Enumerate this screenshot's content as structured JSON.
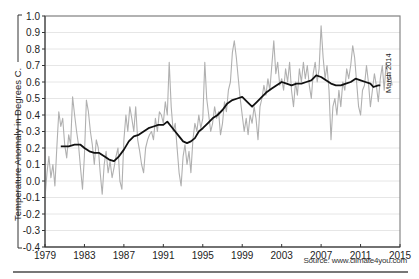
{
  "chart_data": {
    "type": "line",
    "title": "",
    "xlabel": "",
    "ylabel": "Temperature Anomaly in Degrees C.",
    "xlim": [
      1979,
      2015
    ],
    "ylim": [
      -0.4,
      1.0
    ],
    "x_ticks": [
      "1979",
      "1983",
      "1987",
      "1991",
      "1995",
      "1999",
      "2003",
      "2007",
      "2011",
      "2015"
    ],
    "y_ticks": [
      "1.0",
      "0.9",
      "0.8",
      "0.7",
      "0.6",
      "0.5",
      "0.4",
      "0.3",
      "0.2",
      "0.1",
      "0.0",
      "-0.1",
      "-0.2",
      "-0.3",
      "-0.4"
    ],
    "grid": true,
    "annotation": "March 2014",
    "source": "Source: www.climate4you.com",
    "series": [
      {
        "name": "Monthly temperature anomaly",
        "color": "#b0b0b0",
        "points": [
          [
            1979.0,
            -0.1
          ],
          [
            1979.2,
            0.05
          ],
          [
            1979.4,
            0.15
          ],
          [
            1979.6,
            0.02
          ],
          [
            1979.8,
            0.1
          ],
          [
            1980.0,
            -0.03
          ],
          [
            1980.2,
            0.2
          ],
          [
            1980.4,
            0.42
          ],
          [
            1980.6,
            0.33
          ],
          [
            1980.8,
            0.38
          ],
          [
            1981.0,
            0.22
          ],
          [
            1981.2,
            0.14
          ],
          [
            1981.4,
            0.28
          ],
          [
            1981.6,
            0.22
          ],
          [
            1981.8,
            0.51
          ],
          [
            1982.0,
            0.4
          ],
          [
            1982.2,
            0.3
          ],
          [
            1982.4,
            0.22
          ],
          [
            1982.6,
            0.08
          ],
          [
            1982.8,
            -0.05
          ],
          [
            1983.0,
            0.15
          ],
          [
            1983.2,
            0.49
          ],
          [
            1983.4,
            0.42
          ],
          [
            1983.6,
            0.3
          ],
          [
            1983.8,
            0.22
          ],
          [
            1984.0,
            0.1
          ],
          [
            1984.2,
            0.25
          ],
          [
            1984.4,
            0.2
          ],
          [
            1984.6,
            0.05
          ],
          [
            1984.8,
            -0.08
          ],
          [
            1985.0,
            0.1
          ],
          [
            1985.2,
            0.18
          ],
          [
            1985.4,
            0.05
          ],
          [
            1985.6,
            0.12
          ],
          [
            1985.8,
            0.02
          ],
          [
            1986.0,
            0.08
          ],
          [
            1986.2,
            0.15
          ],
          [
            1986.4,
            0.2
          ],
          [
            1986.6,
            0.0
          ],
          [
            1986.8,
            -0.05
          ],
          [
            1987.0,
            0.25
          ],
          [
            1987.2,
            0.4
          ],
          [
            1987.4,
            0.3
          ],
          [
            1987.6,
            0.45
          ],
          [
            1987.8,
            0.38
          ],
          [
            1988.0,
            0.3
          ],
          [
            1988.2,
            0.45
          ],
          [
            1988.4,
            0.25
          ],
          [
            1988.6,
            0.18
          ],
          [
            1988.8,
            0.1
          ],
          [
            1989.0,
            0.05
          ],
          [
            1989.2,
            0.2
          ],
          [
            1989.4,
            0.25
          ],
          [
            1989.6,
            0.28
          ],
          [
            1989.8,
            0.3
          ],
          [
            1990.0,
            0.25
          ],
          [
            1990.2,
            0.38
          ],
          [
            1990.4,
            0.3
          ],
          [
            1990.6,
            0.42
          ],
          [
            1990.8,
            0.4
          ],
          [
            1991.0,
            0.35
          ],
          [
            1991.2,
            0.48
          ],
          [
            1991.4,
            0.4
          ],
          [
            1991.6,
            0.72
          ],
          [
            1991.8,
            0.45
          ],
          [
            1992.0,
            0.3
          ],
          [
            1992.2,
            0.35
          ],
          [
            1992.4,
            0.2
          ],
          [
            1992.6,
            0.05
          ],
          [
            1992.8,
            -0.03
          ],
          [
            1993.0,
            0.15
          ],
          [
            1993.2,
            0.22
          ],
          [
            1993.4,
            0.1
          ],
          [
            1993.6,
            0.18
          ],
          [
            1993.8,
            0.05
          ],
          [
            1994.0,
            0.25
          ],
          [
            1994.2,
            0.35
          ],
          [
            1994.4,
            0.3
          ],
          [
            1994.6,
            0.4
          ],
          [
            1994.8,
            0.32
          ],
          [
            1995.0,
            0.38
          ],
          [
            1995.2,
            0.72
          ],
          [
            1995.4,
            0.5
          ],
          [
            1995.6,
            0.4
          ],
          [
            1995.8,
            0.3
          ],
          [
            1996.0,
            0.35
          ],
          [
            1996.2,
            0.45
          ],
          [
            1996.4,
            0.38
          ],
          [
            1996.6,
            0.42
          ],
          [
            1996.8,
            0.28
          ],
          [
            1997.0,
            0.35
          ],
          [
            1997.2,
            0.48
          ],
          [
            1997.4,
            0.42
          ],
          [
            1997.6,
            0.55
          ],
          [
            1997.8,
            0.6
          ],
          [
            1998.0,
            0.78
          ],
          [
            1998.2,
            0.85
          ],
          [
            1998.4,
            0.75
          ],
          [
            1998.6,
            0.62
          ],
          [
            1998.8,
            0.5
          ],
          [
            1999.0,
            0.4
          ],
          [
            1999.2,
            0.3
          ],
          [
            1999.4,
            0.38
          ],
          [
            1999.6,
            0.28
          ],
          [
            1999.8,
            0.4
          ],
          [
            2000.0,
            0.35
          ],
          [
            2000.2,
            0.45
          ],
          [
            2000.4,
            0.38
          ],
          [
            2000.6,
            0.25
          ],
          [
            2000.8,
            0.45
          ],
          [
            2001.0,
            0.5
          ],
          [
            2001.2,
            0.58
          ],
          [
            2001.4,
            0.52
          ],
          [
            2001.6,
            0.62
          ],
          [
            2001.8,
            0.55
          ],
          [
            2002.0,
            0.7
          ],
          [
            2002.2,
            0.85
          ],
          [
            2002.4,
            0.65
          ],
          [
            2002.6,
            0.72
          ],
          [
            2002.8,
            0.58
          ],
          [
            2003.0,
            0.62
          ],
          [
            2003.2,
            0.55
          ],
          [
            2003.4,
            0.68
          ],
          [
            2003.6,
            0.6
          ],
          [
            2003.8,
            0.72
          ],
          [
            2004.0,
            0.55
          ],
          [
            2004.2,
            0.45
          ],
          [
            2004.4,
            0.6
          ],
          [
            2004.6,
            0.52
          ],
          [
            2004.8,
            0.68
          ],
          [
            2005.0,
            0.6
          ],
          [
            2005.2,
            0.72
          ],
          [
            2005.4,
            0.62
          ],
          [
            2005.6,
            0.7
          ],
          [
            2005.8,
            0.58
          ],
          [
            2006.0,
            0.5
          ],
          [
            2006.2,
            0.65
          ],
          [
            2006.4,
            0.72
          ],
          [
            2006.6,
            0.6
          ],
          [
            2006.8,
            0.68
          ],
          [
            2007.0,
            0.94
          ],
          [
            2007.2,
            0.75
          ],
          [
            2007.4,
            0.62
          ],
          [
            2007.6,
            0.7
          ],
          [
            2007.8,
            0.55
          ],
          [
            2008.0,
            0.25
          ],
          [
            2008.2,
            0.45
          ],
          [
            2008.4,
            0.5
          ],
          [
            2008.6,
            0.4
          ],
          [
            2008.8,
            0.55
          ],
          [
            2009.0,
            0.45
          ],
          [
            2009.2,
            0.6
          ],
          [
            2009.4,
            0.55
          ],
          [
            2009.6,
            0.68
          ],
          [
            2009.8,
            0.62
          ],
          [
            2010.0,
            0.7
          ],
          [
            2010.2,
            0.82
          ],
          [
            2010.4,
            0.75
          ],
          [
            2010.6,
            0.6
          ],
          [
            2010.8,
            0.45
          ],
          [
            2011.0,
            0.4
          ],
          [
            2011.2,
            0.55
          ],
          [
            2011.4,
            0.58
          ],
          [
            2011.6,
            0.7
          ],
          [
            2011.8,
            0.6
          ],
          [
            2012.0,
            0.45
          ],
          [
            2012.2,
            0.55
          ],
          [
            2012.4,
            0.65
          ],
          [
            2012.6,
            0.58
          ],
          [
            2012.8,
            0.48
          ],
          [
            2013.0,
            0.62
          ],
          [
            2013.2,
            0.7
          ],
          [
            2013.4,
            0.55
          ],
          [
            2013.6,
            0.72
          ],
          [
            2013.8,
            0.6
          ],
          [
            2014.0,
            0.65
          ],
          [
            2014.2,
            0.58
          ]
        ]
      },
      {
        "name": "37-month running average",
        "color": "#111111",
        "points": [
          [
            1980.6,
            0.21
          ],
          [
            1981.0,
            0.21
          ],
          [
            1981.4,
            0.21
          ],
          [
            1982.0,
            0.22
          ],
          [
            1982.6,
            0.22
          ],
          [
            1983.0,
            0.2
          ],
          [
            1983.5,
            0.18
          ],
          [
            1984.0,
            0.17
          ],
          [
            1984.5,
            0.17
          ],
          [
            1985.0,
            0.15
          ],
          [
            1985.5,
            0.13
          ],
          [
            1986.0,
            0.12
          ],
          [
            1986.5,
            0.15
          ],
          [
            1987.0,
            0.19
          ],
          [
            1987.5,
            0.24
          ],
          [
            1988.0,
            0.27
          ],
          [
            1988.5,
            0.28
          ],
          [
            1989.0,
            0.3
          ],
          [
            1989.5,
            0.32
          ],
          [
            1990.0,
            0.33
          ],
          [
            1990.5,
            0.34
          ],
          [
            1991.0,
            0.34
          ],
          [
            1991.4,
            0.36
          ],
          [
            1991.8,
            0.33
          ],
          [
            1992.2,
            0.3
          ],
          [
            1992.6,
            0.27
          ],
          [
            1993.0,
            0.24
          ],
          [
            1993.4,
            0.23
          ],
          [
            1993.8,
            0.24
          ],
          [
            1994.2,
            0.26
          ],
          [
            1994.6,
            0.3
          ],
          [
            1995.0,
            0.32
          ],
          [
            1995.5,
            0.35
          ],
          [
            1996.0,
            0.38
          ],
          [
            1996.5,
            0.4
          ],
          [
            1997.0,
            0.43
          ],
          [
            1997.5,
            0.47
          ],
          [
            1998.0,
            0.49
          ],
          [
            1998.5,
            0.5
          ],
          [
            1999.0,
            0.51
          ],
          [
            1999.5,
            0.48
          ],
          [
            2000.0,
            0.45
          ],
          [
            2000.5,
            0.48
          ],
          [
            2001.0,
            0.51
          ],
          [
            2001.5,
            0.54
          ],
          [
            2002.0,
            0.56
          ],
          [
            2002.5,
            0.58
          ],
          [
            2003.0,
            0.6
          ],
          [
            2003.5,
            0.59
          ],
          [
            2004.0,
            0.58
          ],
          [
            2004.5,
            0.59
          ],
          [
            2005.0,
            0.59
          ],
          [
            2005.5,
            0.6
          ],
          [
            2006.0,
            0.61
          ],
          [
            2006.5,
            0.64
          ],
          [
            2007.0,
            0.63
          ],
          [
            2007.5,
            0.61
          ],
          [
            2008.0,
            0.59
          ],
          [
            2008.5,
            0.58
          ],
          [
            2009.0,
            0.58
          ],
          [
            2009.5,
            0.59
          ],
          [
            2010.0,
            0.6
          ],
          [
            2010.5,
            0.62
          ],
          [
            2011.0,
            0.61
          ],
          [
            2011.5,
            0.6
          ],
          [
            2012.0,
            0.59
          ],
          [
            2012.3,
            0.57
          ],
          [
            2012.8,
            0.58
          ],
          [
            2013.0,
            0.58
          ]
        ]
      }
    ]
  },
  "labels": {
    "ylabel": "Temperature Anomaly in Degrees C.",
    "annotation": "March 2014",
    "source": "Source: www.climate4you.com"
  },
  "colors": {
    "monthly": "#b0b0b0",
    "average": "#111111",
    "grid": "#e6e6e6",
    "frame": "#888888",
    "axis": "#333333"
  }
}
